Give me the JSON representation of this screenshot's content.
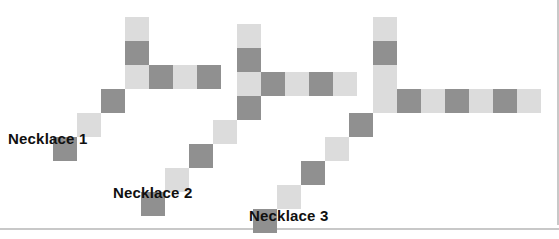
{
  "figure": {
    "background_color": "#ffffff",
    "width": 559,
    "height": 239,
    "bead_size": 24,
    "colors": {
      "light_bead": "#dcdcdc",
      "dark_bead": "#909090",
      "label_text": "#101010",
      "rule": "#c8c8c8"
    }
  },
  "labels": {
    "necklace1": "Necklace 1",
    "necklace2": "Necklace 2",
    "necklace3": "Necklace 3"
  },
  "necklaces": [
    {
      "name": "Necklace 1",
      "label_position": {
        "x": 8,
        "y": 130
      },
      "bead_count": 9,
      "light_count": 4,
      "dark_count": 5,
      "vertical_arm_length": 3,
      "horizontal_arm_length": 4,
      "diagonal_tail_length": 3,
      "beads": [
        {
          "x": 125,
          "y": 17,
          "color": "light"
        },
        {
          "x": 125,
          "y": 41,
          "color": "dark"
        },
        {
          "x": 125,
          "y": 65,
          "color": "light"
        },
        {
          "x": 149,
          "y": 65,
          "color": "dark"
        },
        {
          "x": 173,
          "y": 65,
          "color": "light"
        },
        {
          "x": 197,
          "y": 65,
          "color": "dark"
        },
        {
          "x": 101,
          "y": 89,
          "color": "dark"
        },
        {
          "x": 77,
          "y": 113,
          "color": "light"
        },
        {
          "x": 53,
          "y": 137,
          "color": "dark"
        }
      ]
    },
    {
      "name": "Necklace 2",
      "label_position": {
        "x": 113,
        "y": 184
      },
      "bead_count": 13,
      "light_count": 6,
      "dark_count": 7,
      "vertical_arm_length": 4,
      "horizontal_arm_length": 5,
      "diagonal_tail_length": 5,
      "beads": [
        {
          "x": 237,
          "y": 24,
          "color": "light"
        },
        {
          "x": 237,
          "y": 48,
          "color": "dark"
        },
        {
          "x": 237,
          "y": 72,
          "color": "light"
        },
        {
          "x": 237,
          "y": 96,
          "color": "dark"
        },
        {
          "x": 261,
          "y": 72,
          "color": "dark"
        },
        {
          "x": 285,
          "y": 72,
          "color": "light"
        },
        {
          "x": 309,
          "y": 72,
          "color": "dark"
        },
        {
          "x": 333,
          "y": 72,
          "color": "light"
        },
        {
          "x": 213,
          "y": 120,
          "color": "light"
        },
        {
          "x": 189,
          "y": 144,
          "color": "dark"
        },
        {
          "x": 165,
          "y": 168,
          "color": "light"
        },
        {
          "x": 141,
          "y": 192,
          "color": "dark"
        }
      ]
    },
    {
      "name": "Necklace 3",
      "label_position": {
        "x": 249,
        "y": 207
      },
      "bead_count": 17,
      "light_count": 8,
      "dark_count": 9,
      "vertical_arm_length": 5,
      "horizontal_arm_length": 7,
      "diagonal_tail_length": 5,
      "beads": [
        {
          "x": 373,
          "y": 17,
          "color": "light"
        },
        {
          "x": 373,
          "y": 41,
          "color": "dark"
        },
        {
          "x": 373,
          "y": 65,
          "color": "light"
        },
        {
          "x": 373,
          "y": 89,
          "color": "light"
        },
        {
          "x": 397,
          "y": 89,
          "color": "dark"
        },
        {
          "x": 421,
          "y": 89,
          "color": "light"
        },
        {
          "x": 445,
          "y": 89,
          "color": "dark"
        },
        {
          "x": 469,
          "y": 89,
          "color": "light"
        },
        {
          "x": 493,
          "y": 89,
          "color": "dark"
        },
        {
          "x": 517,
          "y": 89,
          "color": "light"
        },
        {
          "x": 349,
          "y": 113,
          "color": "dark"
        },
        {
          "x": 325,
          "y": 137,
          "color": "light"
        },
        {
          "x": 301,
          "y": 161,
          "color": "dark"
        },
        {
          "x": 277,
          "y": 185,
          "color": "light"
        },
        {
          "x": 253,
          "y": 209,
          "color": "dark"
        }
      ]
    }
  ]
}
